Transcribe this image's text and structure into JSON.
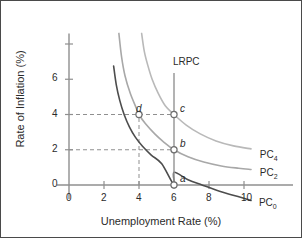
{
  "figure": {
    "kind": "phillips-curve-diagram"
  },
  "chart_data": {
    "type": "line",
    "title": "",
    "xlabel": "Unemployment Rate (%)",
    "ylabel": "Rate of Inflation (%)",
    "xlim": [
      0,
      11.6
    ],
    "ylim": [
      0,
      8.6
    ],
    "xticks": [
      0,
      2,
      4,
      6,
      8,
      10
    ],
    "xtick_labels": [
      "0",
      "2",
      "4",
      "6",
      "8",
      "10"
    ],
    "yticks": [
      0,
      2,
      4,
      6,
      8
    ],
    "ytick_labels": [
      "0",
      "2",
      "4",
      "6",
      ""
    ],
    "grid": false,
    "legend": "inline-curve-labels",
    "series": [
      {
        "name": "PC0",
        "label": "PC",
        "sub": "0",
        "color": "#4d4d4d",
        "width": 1.6,
        "label_x": 10.85,
        "label_y": -1.05,
        "points": [
          [
            2.55,
            6.75
          ],
          [
            2.7,
            5.7
          ],
          [
            2.9,
            4.8
          ],
          [
            3.15,
            4.0
          ],
          [
            3.45,
            3.3
          ],
          [
            3.8,
            2.7
          ],
          [
            4.2,
            2.2
          ],
          [
            4.7,
            1.7
          ],
          [
            5.3,
            1.2
          ],
          [
            6.0,
            0.0
          ],
          [
            6.0,
            0.72
          ],
          [
            6.8,
            0.3
          ],
          [
            7.6,
            0.0
          ],
          [
            8.6,
            -0.35
          ],
          [
            9.8,
            -0.7
          ],
          [
            10.4,
            -0.88
          ]
        ],
        "endpoint_note": "passes through point a at (6, 0)"
      },
      {
        "name": "PC2",
        "label": "PC",
        "sub": "2",
        "color": "#a8a8a8",
        "width": 1.6,
        "label_x": 10.9,
        "label_y": 0.62,
        "points": [
          [
            2.85,
            8.6
          ],
          [
            3.0,
            7.3
          ],
          [
            3.2,
            6.2
          ],
          [
            3.5,
            5.2
          ],
          [
            3.85,
            4.35
          ],
          [
            4.0,
            4.0
          ],
          [
            4.35,
            3.5
          ],
          [
            4.9,
            2.9
          ],
          [
            5.4,
            2.45
          ],
          [
            6.0,
            2.0
          ],
          [
            6.8,
            1.6
          ],
          [
            7.7,
            1.3
          ],
          [
            8.7,
            1.08
          ],
          [
            9.7,
            0.95
          ],
          [
            10.4,
            0.88
          ]
        ],
        "endpoint_note": "passes through point d at (4, 4) and point b at (6, 2)"
      },
      {
        "name": "PC4",
        "label": "PC",
        "sub": "4",
        "color": "#b9b9b9",
        "width": 1.6,
        "label_x": 10.9,
        "label_y": 1.62,
        "points": [
          [
            4.15,
            8.6
          ],
          [
            4.3,
            7.6
          ],
          [
            4.5,
            6.8
          ],
          [
            4.75,
            6.0
          ],
          [
            5.1,
            5.2
          ],
          [
            5.5,
            4.5
          ],
          [
            6.0,
            4.0
          ],
          [
            6.7,
            3.4
          ],
          [
            7.5,
            2.9
          ],
          [
            8.4,
            2.5
          ],
          [
            9.4,
            2.22
          ],
          [
            10.4,
            2.05
          ]
        ],
        "endpoint_note": "passes through point c at (6, 4)"
      }
    ],
    "vertical_line": {
      "name": "LRPC",
      "label": "LRPC",
      "x": 6.0,
      "y_from": 0.0,
      "y_to": 6.35,
      "color": "#9a9a9a",
      "label_x": 6.05,
      "label_y": 6.9
    },
    "points": [
      {
        "id": "a",
        "label": "a",
        "x": 6.0,
        "y": 0.0,
        "label_dx": 6,
        "label_dy": -12,
        "marker": "open-circle"
      },
      {
        "id": "b",
        "label": "b",
        "x": 6.0,
        "y": 2.0,
        "label_dx": 6,
        "label_dy": -12,
        "marker": "open-circle"
      },
      {
        "id": "c",
        "label": "c",
        "x": 6.0,
        "y": 4.0,
        "label_dx": 6,
        "label_dy": -12,
        "marker": "open-circle"
      },
      {
        "id": "d",
        "label": "d",
        "x": 4.0,
        "y": 4.0,
        "label_dx": -3,
        "label_dy": -12,
        "marker": "open-circle"
      }
    ],
    "guides": [
      {
        "type": "horizontal-dashed",
        "y": 4.0,
        "x_from": 0.0,
        "x_to": 6.0
      },
      {
        "type": "horizontal-dashed",
        "y": 2.0,
        "x_from": 0.0,
        "x_to": 6.0
      },
      {
        "type": "vertical-dashed",
        "x": 4.0,
        "y_from": 0.0,
        "y_to": 4.0
      }
    ],
    "annotations": [
      {
        "text": "LRPC",
        "meaning": "long-run Phillips curve at natural rate of unemployment 6%"
      },
      {
        "text": "PC0",
        "meaning": "short-run Phillips curve, expected inflation 0%"
      },
      {
        "text": "PC2",
        "meaning": "short-run Phillips curve, expected inflation 2%"
      },
      {
        "text": "PC4",
        "meaning": "short-run Phillips curve, expected inflation 4%"
      }
    ]
  },
  "style": {
    "axis_color": "#8f8f8f",
    "text_color": "#2b2b2b",
    "frame_color": "#4a4a4a",
    "dash_color": "#8f8f8f",
    "background": "#ffffff"
  }
}
